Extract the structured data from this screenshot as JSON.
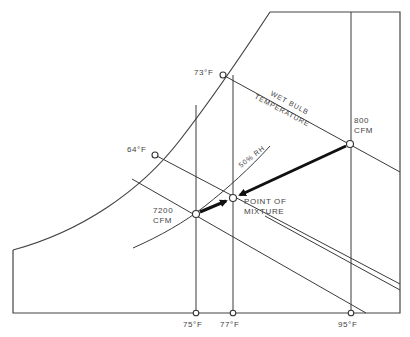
{
  "diagram": {
    "labels": {
      "wb_73": "73°F",
      "wb_64": "64°F",
      "wet_bulb_line1": "WET BULB",
      "wet_bulb_line2": "TEMPERATURE",
      "rh_curve": "50% RH",
      "stream_outdoor_cfm": "800",
      "stream_outdoor_unit": "CFM",
      "stream_return_cfm": "7200",
      "stream_return_unit": "CFM",
      "mixture_line1": "POINT OF",
      "mixture_line2": "MIXTURE",
      "db_75": "75°F",
      "db_77": "77°F",
      "db_95": "95°F"
    },
    "streams": [
      {
        "name": "outdoor air",
        "flow_cfm": 800,
        "dry_bulb_f": 95,
        "wet_bulb_f": 73
      },
      {
        "name": "return air",
        "flow_cfm": 7200,
        "dry_bulb_f": 75,
        "relative_humidity_pct": 50
      },
      {
        "name": "mixture",
        "dry_bulb_f": 77
      }
    ],
    "colors": {
      "line": "#3a3a3a",
      "background": "#ffffff"
    }
  }
}
